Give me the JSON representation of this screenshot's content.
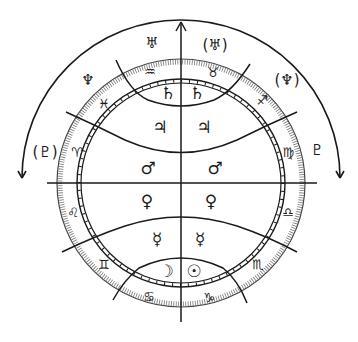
{
  "diagram": {
    "type": "astrological-chart",
    "colors": {
      "ink": "#1a1a1a",
      "background": "#ffffff"
    },
    "axis_arrow": "up-arrow",
    "outer_arcs": [
      "left-arc-arrow-down",
      "right-arc-arrow-down"
    ],
    "outer_planets": [
      {
        "name": "uranus",
        "glyph": "♅",
        "x": 152,
        "y": 43
      },
      {
        "name": "uranus-parenthesized",
        "glyph": "(♅)",
        "x": 215,
        "y": 45
      },
      {
        "name": "neptune-left",
        "glyph": "♆",
        "x": 88,
        "y": 80
      },
      {
        "name": "neptune-parenthesized",
        "glyph": "(♆)",
        "x": 287,
        "y": 80
      },
      {
        "name": "pluto-parenthesized",
        "glyph": "(♇)",
        "x": 45,
        "y": 152
      },
      {
        "name": "pluto-right",
        "glyph": "♇",
        "x": 317,
        "y": 150
      }
    ],
    "signs": [
      {
        "name": "aquarius",
        "glyph": "♒",
        "x": 150,
        "y": 71
      },
      {
        "name": "taurus",
        "glyph": "♉",
        "x": 213,
        "y": 72
      },
      {
        "name": "pisces",
        "glyph": "♓",
        "x": 104,
        "y": 103
      },
      {
        "name": "sagittarius",
        "glyph": "♐",
        "x": 262,
        "y": 100
      },
      {
        "name": "aries",
        "glyph": "♈",
        "x": 77,
        "y": 152
      },
      {
        "name": "virgo",
        "glyph": "♍",
        "x": 288,
        "y": 152
      },
      {
        "name": "leo",
        "glyph": "♌",
        "x": 73,
        "y": 212
      },
      {
        "name": "libra",
        "glyph": "♎",
        "x": 288,
        "y": 212
      },
      {
        "name": "gemini",
        "glyph": "♊",
        "x": 104,
        "y": 264
      },
      {
        "name": "scorpio",
        "glyph": "♏",
        "x": 258,
        "y": 264
      },
      {
        "name": "cancer",
        "glyph": "♋",
        "x": 149,
        "y": 296
      },
      {
        "name": "capricorn",
        "glyph": "♑",
        "x": 209,
        "y": 297
      }
    ],
    "inner_planets": [
      {
        "name": "saturn-left",
        "glyph": "♄",
        "x": 168,
        "y": 93
      },
      {
        "name": "saturn-right",
        "glyph": "♄",
        "x": 197,
        "y": 93
      },
      {
        "name": "jupiter-left",
        "glyph": "♃",
        "x": 160,
        "y": 127
      },
      {
        "name": "jupiter-right",
        "glyph": "♃",
        "x": 204,
        "y": 127
      },
      {
        "name": "mars-left",
        "glyph": "♂",
        "x": 148,
        "y": 168
      },
      {
        "name": "mars-right",
        "glyph": "♂",
        "x": 215,
        "y": 168
      },
      {
        "name": "venus-left",
        "glyph": "♀",
        "x": 147,
        "y": 201
      },
      {
        "name": "venus-right",
        "glyph": "♀",
        "x": 211,
        "y": 201
      },
      {
        "name": "mercury-left",
        "glyph": "☿",
        "x": 157,
        "y": 239
      },
      {
        "name": "mercury-right",
        "glyph": "☿",
        "x": 200,
        "y": 239
      },
      {
        "name": "moon",
        "glyph": "☽",
        "x": 166,
        "y": 271
      },
      {
        "name": "sun",
        "glyph": "☉",
        "x": 194,
        "y": 271
      }
    ]
  }
}
